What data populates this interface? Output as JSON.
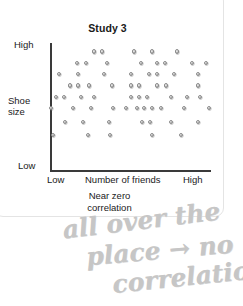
{
  "card": {
    "title": "Study 3"
  },
  "chart_data": {
    "type": "scatter",
    "title": "Study 3",
    "xlabel": "Number of friends",
    "ylabel": "Shoe size",
    "caption_lines": [
      "Near zero",
      "correlation"
    ],
    "caption": "Near zero correlation",
    "x_ticks": [
      "Low",
      "High"
    ],
    "y_ticks": [
      "High",
      "Low"
    ],
    "xlim": [
      0,
      100
    ],
    "ylim": [
      0,
      100
    ],
    "grid": false,
    "legend": "none",
    "point_color": "#b0b0b0",
    "axis_color": "#3a3a3a",
    "n_points": 75,
    "points": [
      [
        27,
        94
      ],
      [
        32,
        94
      ],
      [
        52,
        94
      ],
      [
        63,
        94
      ],
      [
        79,
        94
      ],
      [
        16,
        85
      ],
      [
        22,
        85
      ],
      [
        35,
        85
      ],
      [
        56,
        85
      ],
      [
        66,
        85
      ],
      [
        71,
        85
      ],
      [
        88,
        85
      ],
      [
        97,
        85
      ],
      [
        5,
        76
      ],
      [
        17,
        76
      ],
      [
        33,
        76
      ],
      [
        50,
        76
      ],
      [
        61,
        76
      ],
      [
        66,
        76
      ],
      [
        77,
        76
      ],
      [
        92,
        76
      ],
      [
        12,
        67
      ],
      [
        17,
        67
      ],
      [
        24,
        67
      ],
      [
        38,
        67
      ],
      [
        50,
        67
      ],
      [
        55,
        67
      ],
      [
        66,
        67
      ],
      [
        72,
        67
      ],
      [
        92,
        67
      ],
      [
        3,
        58
      ],
      [
        8,
        58
      ],
      [
        19,
        58
      ],
      [
        27,
        58
      ],
      [
        50,
        58
      ],
      [
        55,
        58
      ],
      [
        60,
        58
      ],
      [
        75,
        58
      ],
      [
        85,
        58
      ],
      [
        93,
        58
      ],
      [
        0,
        49
      ],
      [
        14,
        49
      ],
      [
        25,
        49
      ],
      [
        39,
        49
      ],
      [
        47,
        49
      ],
      [
        54,
        49
      ],
      [
        58,
        49
      ],
      [
        63,
        49
      ],
      [
        69,
        49
      ],
      [
        83,
        49
      ],
      [
        99,
        49
      ],
      [
        9,
        38
      ],
      [
        20,
        38
      ],
      [
        36,
        38
      ],
      [
        57,
        38
      ],
      [
        62,
        38
      ],
      [
        75,
        38
      ],
      [
        92,
        38
      ],
      [
        1,
        28
      ],
      [
        23,
        28
      ],
      [
        37,
        28
      ],
      [
        63,
        28
      ],
      [
        81,
        28
      ]
    ],
    "correlation": "near zero"
  },
  "annotation": {
    "line1": "all over the",
    "line2": "place → no",
    "line3": "correlation",
    "full_text": "all over the place → no correlation",
    "color": "#c6c6c6"
  }
}
